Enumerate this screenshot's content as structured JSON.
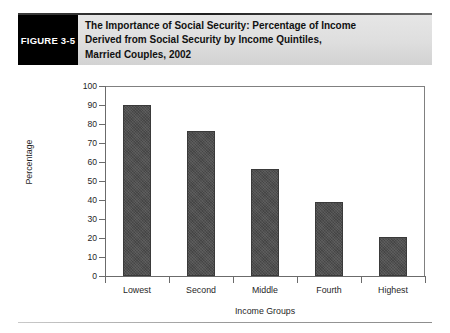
{
  "figure": {
    "number_label": "FIGURE 3-5",
    "title_lines": [
      "The Importance of Social Security: Percentage of Income",
      "Derived from Social Security by Income Quintiles,",
      "Married Couples, 2002"
    ]
  },
  "colors": {
    "figure_box_bg": "#000000",
    "figure_box_text": "#ffffff",
    "title_band_bg": "#dedede",
    "bar_fill": "#4c4c4c",
    "axis_line": "#6b6b6b",
    "plot_border": "#808080",
    "page_bg": "#ffffff"
  },
  "chart_data": {
    "type": "bar",
    "title": "The Importance of Social Security: Percentage of Income Derived from Social Security by Income Quintiles, Married Couples, 2002",
    "categories": [
      "Lowest",
      "Second",
      "Middle",
      "Fourth",
      "Highest"
    ],
    "values": [
      90,
      76.5,
      56.5,
      39,
      20.5
    ],
    "series": [
      {
        "name": "Percentage of income derived from Social Security",
        "values": [
          90,
          76.5,
          56.5,
          39,
          20.5
        ]
      }
    ],
    "xlabel": "Income Groups",
    "ylabel": "Percentage",
    "ylim": [
      0,
      100
    ],
    "ytick_step": 10,
    "yticks": [
      0,
      10,
      20,
      30,
      40,
      50,
      60,
      70,
      80,
      90,
      100
    ],
    "ytick_labels": [
      "0",
      "10",
      "20",
      "30",
      "40",
      "50",
      "60",
      "70",
      "80",
      "90",
      "100"
    ],
    "grid": false,
    "legend": false,
    "legend_position": "none"
  }
}
